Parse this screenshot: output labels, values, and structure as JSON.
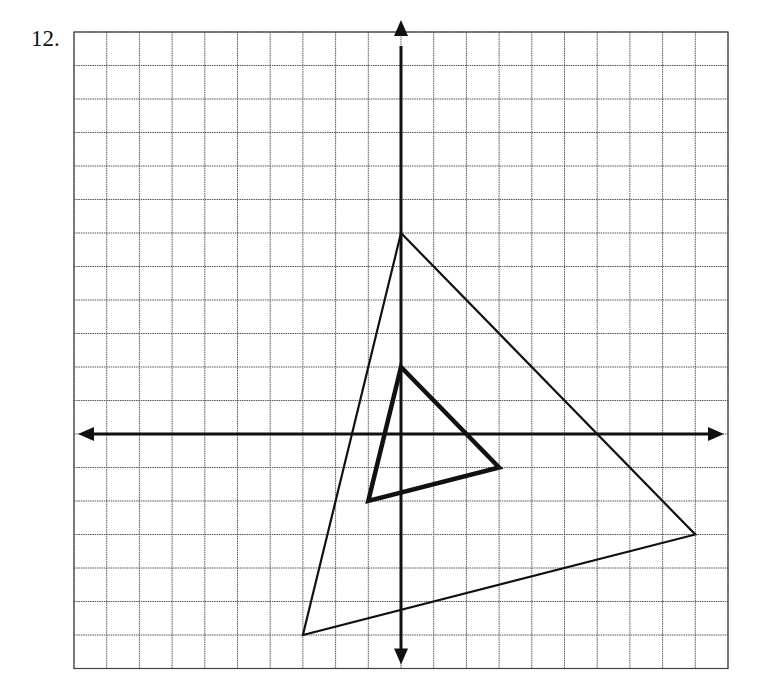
{
  "problem": {
    "number_label": "12."
  },
  "colors": {
    "grid": "#555555",
    "axis": "#111111",
    "shape": "#111111",
    "background": "#ffffff"
  },
  "grid": {
    "x_min": -10,
    "x_max": 10,
    "y_min": -7,
    "y_max": 12,
    "step": 1,
    "origin_px": [
      401,
      434
    ],
    "unit_px": [
      32.7,
      33.5
    ]
  },
  "chart_data": {
    "type": "diagram",
    "title": "12.",
    "axes": {
      "x_range": [
        -10,
        10
      ],
      "y_range": [
        -7,
        12
      ],
      "grid": true,
      "tick_labels": false
    },
    "shapes": [
      {
        "name": "large-triangle",
        "style": "thin",
        "vertices": [
          [
            0,
            6
          ],
          [
            9,
            -3
          ],
          [
            -3,
            -6
          ]
        ]
      },
      {
        "name": "small-triangle",
        "style": "bold",
        "vertices": [
          [
            0,
            2
          ],
          [
            3,
            -1
          ],
          [
            -1,
            -2
          ]
        ]
      }
    ]
  }
}
